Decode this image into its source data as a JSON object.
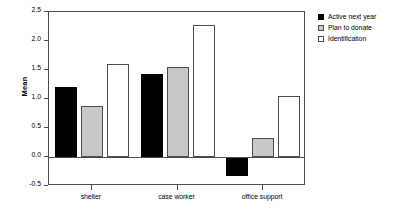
{
  "chart_data": {
    "type": "bar",
    "title": "",
    "subtitle": "",
    "xlabel": "",
    "ylabel": "Mean",
    "categories": [
      "shelter",
      "case worker",
      "office support"
    ],
    "series": [
      {
        "name": "Active next year",
        "values": [
          1.21,
          1.43,
          -0.33
        ],
        "color": "#000000"
      },
      {
        "name": "Plan to donate",
        "values": [
          0.88,
          1.56,
          0.33
        ],
        "color": "#c8c8c8"
      },
      {
        "name": "Identification",
        "values": [
          1.6,
          2.28,
          1.06
        ],
        "color": "#ffffff"
      }
    ],
    "ylim": [
      -0.5,
      2.5
    ],
    "yticks": [
      2.5,
      2.0,
      1.5,
      1.0,
      0.5,
      0.0,
      -0.5
    ],
    "ytick_labels": [
      "2.5",
      "2.0",
      "1.5",
      "1.0",
      "0.5",
      "0.0",
      "-0.5"
    ],
    "grid": false,
    "legend_position": "right",
    "zero_line": 0.0
  },
  "legend": {
    "entries": [
      {
        "label": "Active next year"
      },
      {
        "label": "Plan to donate"
      },
      {
        "label": "Identification"
      }
    ]
  },
  "axes": {
    "y_label": "Mean"
  }
}
